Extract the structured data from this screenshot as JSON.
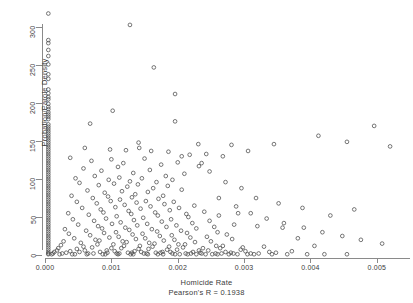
{
  "chart_data": {
    "type": "scatter",
    "title": "",
    "xlabel": "Homicide Rate",
    "ylabel": "Probation/Parole Density",
    "annotation": "Pearson's R = 0.1938",
    "pearson_r": 0.1938,
    "grid": false,
    "legend": null,
    "xlim": [
      0.0,
      0.0055
    ],
    "ylim": [
      0,
      320
    ],
    "xticks": [
      0.0,
      0.001,
      0.002,
      0.003,
      0.004,
      0.005
    ],
    "xtick_labels": [
      "0.000",
      "0.001",
      "0.002",
      "0.003",
      "0.004",
      "0.005"
    ],
    "yticks": [
      0,
      50,
      100,
      150,
      200,
      250,
      300
    ],
    "ytick_labels": [
      "0",
      "50",
      "100",
      "150",
      "200",
      "250",
      "300"
    ],
    "marker": "open-circle",
    "marker_color": "#4a4a4a",
    "points": [
      [
        5e-05,
        318
      ],
      [
        0.00128,
        303
      ],
      [
        5e-05,
        283
      ],
      [
        5e-05,
        279
      ],
      [
        5e-05,
        270
      ],
      [
        5e-05,
        262
      ],
      [
        5e-05,
        251
      ],
      [
        0.00164,
        247
      ],
      [
        5e-05,
        238
      ],
      [
        5e-05,
        232
      ],
      [
        0.00196,
        212
      ],
      [
        5e-05,
        218
      ],
      [
        5e-05,
        213
      ],
      [
        5e-05,
        208
      ],
      [
        5e-05,
        205
      ],
      [
        0.00102,
        190
      ],
      [
        5e-05,
        199
      ],
      [
        5e-05,
        195
      ],
      [
        5e-05,
        192
      ],
      [
        5e-05,
        188
      ],
      [
        5e-05,
        185
      ],
      [
        5e-05,
        182
      ],
      [
        5e-05,
        179
      ],
      [
        0.00196,
        176
      ],
      [
        0.00068,
        173
      ],
      [
        5e-05,
        172
      ],
      [
        5e-05,
        169
      ],
      [
        5e-05,
        166
      ],
      [
        5e-05,
        163
      ],
      [
        5e-05,
        160
      ],
      [
        5e-05,
        157
      ],
      [
        5e-05,
        154
      ],
      [
        5e-05,
        151
      ],
      [
        5e-05,
        148
      ],
      [
        5e-05,
        145
      ],
      [
        0.00141,
        148
      ],
      [
        0.00231,
        146
      ],
      [
        0.00281,
        145
      ],
      [
        0.00345,
        146
      ],
      [
        5e-05,
        142
      ],
      [
        5e-05,
        139
      ],
      [
        5e-05,
        136
      ],
      [
        5e-05,
        133
      ],
      [
        5e-05,
        130
      ],
      [
        5e-05,
        127
      ],
      [
        5e-05,
        124
      ],
      [
        5e-05,
        121
      ],
      [
        5e-05,
        118
      ],
      [
        5e-05,
        115
      ],
      [
        5e-05,
        112
      ],
      [
        5e-05,
        109
      ],
      [
        5e-05,
        106
      ],
      [
        5e-05,
        103
      ],
      [
        5e-05,
        100
      ],
      [
        5e-05,
        97
      ],
      [
        5e-05,
        94
      ],
      [
        5e-05,
        91
      ],
      [
        5e-05,
        88
      ],
      [
        5e-05,
        85
      ],
      [
        5e-05,
        82
      ],
      [
        5e-05,
        79
      ],
      [
        5e-05,
        76
      ],
      [
        5e-05,
        73
      ],
      [
        5e-05,
        70
      ],
      [
        5e-05,
        67
      ],
      [
        5e-05,
        64
      ],
      [
        5e-05,
        61
      ],
      [
        5e-05,
        58
      ],
      [
        5e-05,
        55
      ],
      [
        5e-05,
        52
      ],
      [
        5e-05,
        49
      ],
      [
        5e-05,
        46
      ],
      [
        5e-05,
        43
      ],
      [
        5e-05,
        40
      ],
      [
        5e-05,
        37
      ],
      [
        5e-05,
        34
      ],
      [
        5e-05,
        31
      ],
      [
        5e-05,
        28
      ],
      [
        5e-05,
        25
      ],
      [
        5e-05,
        22
      ],
      [
        5e-05,
        19
      ],
      [
        5e-05,
        16
      ],
      [
        5e-05,
        13
      ],
      [
        5e-05,
        10
      ],
      [
        5e-05,
        7
      ],
      [
        5e-05,
        4
      ],
      [
        5e-05,
        2
      ],
      [
        5e-05,
        1
      ],
      [
        0.0006,
        141
      ],
      [
        0.00098,
        139
      ],
      [
        0.00122,
        138
      ],
      [
        0.00142,
        141
      ],
      [
        0.0016,
        137
      ],
      [
        0.00186,
        136
      ],
      [
        0.00218,
        132
      ],
      [
        0.00243,
        133
      ],
      [
        0.00268,
        130
      ],
      [
        0.00306,
        137
      ],
      [
        0.00038,
        128
      ],
      [
        0.0007,
        124
      ],
      [
        0.001,
        126
      ],
      [
        0.00118,
        121
      ],
      [
        0.0015,
        127
      ],
      [
        0.00175,
        119
      ],
      [
        0.002,
        122
      ],
      [
        0.00232,
        117
      ],
      [
        0.00058,
        114
      ],
      [
        0.00085,
        111
      ],
      [
        0.0011,
        116
      ],
      [
        0.00133,
        108
      ],
      [
        0.00158,
        112
      ],
      [
        0.00182,
        104
      ],
      [
        0.0021,
        107
      ],
      [
        0.00046,
        101
      ],
      [
        0.00075,
        104
      ],
      [
        0.00096,
        99
      ],
      [
        0.00112,
        102
      ],
      [
        0.00128,
        97
      ],
      [
        0.00146,
        101
      ],
      [
        0.00168,
        96
      ],
      [
        0.00192,
        99
      ],
      [
        0.00052,
        95
      ],
      [
        0.00081,
        92
      ],
      [
        0.00104,
        94
      ],
      [
        0.00124,
        90
      ],
      [
        0.0014,
        93
      ],
      [
        0.00163,
        88
      ],
      [
        0.00185,
        91
      ],
      [
        0.00206,
        86
      ],
      [
        0.00064,
        85
      ],
      [
        0.0009,
        82
      ],
      [
        0.00116,
        84
      ],
      [
        0.00136,
        80
      ],
      [
        0.00155,
        83
      ],
      [
        0.00178,
        78
      ],
      [
        0.0004,
        78
      ],
      [
        0.00072,
        75
      ],
      [
        0.00095,
        77
      ],
      [
        0.00113,
        73
      ],
      [
        0.00131,
        76
      ],
      [
        0.00152,
        71
      ],
      [
        0.00171,
        74
      ],
      [
        0.00194,
        70
      ],
      [
        0.00048,
        70
      ],
      [
        0.00078,
        68
      ],
      [
        0.00099,
        71
      ],
      [
        0.0012,
        66
      ],
      [
        0.00138,
        69
      ],
      [
        0.00159,
        64
      ],
      [
        0.0018,
        67
      ],
      [
        0.00202,
        62
      ],
      [
        0.00225,
        65
      ],
      [
        0.00056,
        62
      ],
      [
        0.00084,
        60
      ],
      [
        0.00106,
        63
      ],
      [
        0.00126,
        58
      ],
      [
        0.00144,
        61
      ],
      [
        0.00166,
        56
      ],
      [
        0.00188,
        59
      ],
      [
        0.00213,
        54
      ],
      [
        0.0024,
        57
      ],
      [
        0.00262,
        52
      ],
      [
        0.00291,
        55
      ],
      [
        0.00035,
        55
      ],
      [
        0.00066,
        53
      ],
      [
        0.00088,
        56
      ],
      [
        0.00108,
        51
      ],
      [
        0.0013,
        54
      ],
      [
        0.00148,
        49
      ],
      [
        0.0017,
        52
      ],
      [
        0.0019,
        47
      ],
      [
        0.00216,
        50
      ],
      [
        0.00248,
        45
      ],
      [
        0.00042,
        47
      ],
      [
        0.00074,
        45
      ],
      [
        0.00092,
        48
      ],
      [
        0.00114,
        43
      ],
      [
        0.00134,
        46
      ],
      [
        0.00154,
        41
      ],
      [
        0.00176,
        44
      ],
      [
        0.00198,
        39
      ],
      [
        0.00222,
        42
      ],
      [
        0.00255,
        37
      ],
      [
        0.00285,
        40
      ],
      [
        0.0032,
        38
      ],
      [
        0.00358,
        36
      ],
      [
        0.0005,
        40
      ],
      [
        0.0008,
        38
      ],
      [
        0.00101,
        41
      ],
      [
        0.00121,
        36
      ],
      [
        0.00139,
        39
      ],
      [
        0.00161,
        34
      ],
      [
        0.00183,
        37
      ],
      [
        0.00205,
        32
      ],
      [
        0.00228,
        35
      ],
      [
        0.0026,
        30
      ],
      [
        0.0003,
        34
      ],
      [
        0.00062,
        32
      ],
      [
        0.00086,
        35
      ],
      [
        0.00107,
        30
      ],
      [
        0.00127,
        33
      ],
      [
        0.00147,
        28
      ],
      [
        0.00169,
        31
      ],
      [
        0.00191,
        26
      ],
      [
        0.00214,
        29
      ],
      [
        0.00244,
        24
      ],
      [
        0.00274,
        27
      ],
      [
        0.00036,
        28
      ],
      [
        0.00068,
        26
      ],
      [
        0.00089,
        29
      ],
      [
        0.00111,
        24
      ],
      [
        0.00132,
        27
      ],
      [
        0.00151,
        22
      ],
      [
        0.00173,
        25
      ],
      [
        0.00195,
        20
      ],
      [
        0.00219,
        23
      ],
      [
        0.0025,
        18
      ],
      [
        0.00282,
        21
      ],
      [
        0.00044,
        22
      ],
      [
        0.00076,
        20
      ],
      [
        0.00097,
        23
      ],
      [
        0.00117,
        18
      ],
      [
        0.00137,
        21
      ],
      [
        0.00157,
        16
      ],
      [
        0.00179,
        19
      ],
      [
        0.00201,
        14
      ],
      [
        0.00226,
        17
      ],
      [
        0.00258,
        12
      ],
      [
        0.00028,
        18
      ],
      [
        0.00054,
        16
      ],
      [
        0.00082,
        19
      ],
      [
        0.00103,
        14
      ],
      [
        0.00123,
        17
      ],
      [
        0.00143,
        12
      ],
      [
        0.00165,
        15
      ],
      [
        0.00187,
        11
      ],
      [
        0.00211,
        14
      ],
      [
        0.00238,
        9
      ],
      [
        0.00268,
        12
      ],
      [
        0.00298,
        10
      ],
      [
        0.0033,
        11
      ],
      [
        0.00024,
        13
      ],
      [
        0.00058,
        11
      ],
      [
        0.00079,
        14
      ],
      [
        0.001,
        9
      ],
      [
        0.00119,
        12
      ],
      [
        0.00141,
        8
      ],
      [
        0.00162,
        11
      ],
      [
        0.00184,
        7
      ],
      [
        0.00208,
        10
      ],
      [
        0.00232,
        6
      ],
      [
        0.00264,
        9
      ],
      [
        0.00295,
        7
      ],
      [
        0.0002,
        9
      ],
      [
        0.00048,
        8
      ],
      [
        0.00071,
        10
      ],
      [
        0.00093,
        6
      ],
      [
        0.00115,
        9
      ],
      [
        0.00135,
        5
      ],
      [
        0.00156,
        8
      ],
      [
        0.00177,
        4
      ],
      [
        0.00199,
        7
      ],
      [
        0.00223,
        4
      ],
      [
        0.00246,
        6
      ],
      [
        0.00272,
        4
      ],
      [
        0.00302,
        5
      ],
      [
        0.00338,
        4
      ],
      [
        0.00372,
        5
      ],
      [
        0.00018,
        6
      ],
      [
        0.00038,
        5
      ],
      [
        0.0006,
        6
      ],
      [
        0.00083,
        4
      ],
      [
        0.00105,
        5
      ],
      [
        0.00125,
        3
      ],
      [
        0.00145,
        4
      ],
      [
        0.00167,
        3
      ],
      [
        0.00189,
        4
      ],
      [
        0.00212,
        2
      ],
      [
        0.00234,
        3
      ],
      [
        0.00257,
        2
      ],
      [
        0.0028,
        3
      ],
      [
        0.0031,
        2
      ],
      [
        0.00348,
        3
      ],
      [
        0.00014,
        4
      ],
      [
        0.00032,
        3
      ],
      [
        0.00052,
        4
      ],
      [
        0.00073,
        2
      ],
      [
        0.00094,
        3
      ],
      [
        0.00112,
        2
      ],
      [
        0.00131,
        3
      ],
      [
        0.00153,
        2
      ],
      [
        0.00174,
        3
      ],
      [
        0.00196,
        1
      ],
      [
        0.0022,
        2
      ],
      [
        0.00242,
        1
      ],
      [
        0.00266,
        2
      ],
      [
        0.0029,
        1
      ],
      [
        0.00322,
        2
      ],
      [
        0.00012,
        2
      ],
      [
        0.00026,
        2
      ],
      [
        0.00045,
        1
      ],
      [
        0.00065,
        2
      ],
      [
        0.00087,
        1
      ],
      [
        0.00108,
        2
      ],
      [
        0.00129,
        1
      ],
      [
        0.00149,
        2
      ],
      [
        0.0017,
        1
      ],
      [
        0.00192,
        2
      ],
      [
        0.00215,
        1
      ],
      [
        0.00236,
        2
      ],
      [
        0.0026,
        1
      ],
      [
        0.00284,
        2
      ],
      [
        0.00315,
        1
      ],
      [
        0.0001,
        1
      ],
      [
        0.00022,
        1
      ],
      [
        0.00041,
        1
      ],
      [
        0.00063,
        1
      ],
      [
        0.00091,
        1
      ],
      [
        0.0011,
        1
      ],
      [
        0.00133,
        1
      ],
      [
        0.00155,
        1
      ],
      [
        0.00178,
        1
      ],
      [
        0.00203,
        1
      ],
      [
        0.00228,
        1
      ],
      [
        0.00252,
        1
      ],
      [
        0.00277,
        1
      ],
      [
        0.00305,
        1
      ],
      [
        0.00342,
        1
      ],
      [
        0.00365,
        1
      ],
      [
        0.00395,
        1
      ],
      [
        0.00421,
        1
      ],
      [
        0.00455,
        1
      ],
      [
        0.00412,
        157
      ],
      [
        0.00455,
        149
      ],
      [
        0.00496,
        170
      ],
      [
        0.0052,
        143
      ],
      [
        0.00388,
        62
      ],
      [
        0.0043,
        52
      ],
      [
        0.00466,
        60
      ],
      [
        0.00381,
        22
      ],
      [
        0.00406,
        12
      ],
      [
        0.00352,
        68
      ],
      [
        0.00318,
        75
      ],
      [
        0.00296,
        88
      ],
      [
        0.00272,
        96
      ],
      [
        0.00248,
        110
      ],
      [
        0.00236,
        121
      ],
      [
        0.00206,
        130
      ],
      [
        0.00262,
        75
      ],
      [
        0.00288,
        64
      ],
      [
        0.0031,
        55
      ],
      [
        0.00334,
        48
      ],
      [
        0.0036,
        42
      ],
      [
        0.0039,
        36
      ],
      [
        0.00418,
        30
      ],
      [
        0.00448,
        25
      ],
      [
        0.00476,
        20
      ],
      [
        0.00508,
        15
      ]
    ]
  }
}
